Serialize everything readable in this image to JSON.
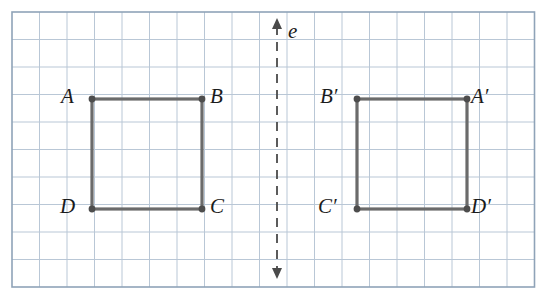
{
  "diagram": {
    "type": "reflection-over-vertical-line",
    "grid": {
      "cell_size": 27.5,
      "columns": 19,
      "rows": 10,
      "line_color": "#b9c7d6",
      "border_color": "#8fa3b8",
      "background": "#ffffff"
    },
    "axis_label": "e",
    "mirror_line": {
      "name": "line-e",
      "color": "#4a4a4a",
      "style": "dashed",
      "x": 277,
      "y_top": 20,
      "y_bottom": 277
    },
    "shapes": [
      {
        "name": "square-ABCD",
        "color": "#6b6b6b",
        "vertices": [
          {
            "label": "A",
            "x": 92,
            "y": 99,
            "label_x": 61,
            "label_y": 88
          },
          {
            "label": "B",
            "x": 202,
            "y": 99,
            "label_x": 210,
            "label_y": 88
          },
          {
            "label": "C",
            "x": 202,
            "y": 209,
            "label_x": 210,
            "label_y": 198
          },
          {
            "label": "D",
            "x": 92,
            "y": 209,
            "label_x": 60,
            "label_y": 198
          }
        ]
      },
      {
        "name": "square-A-prime-B-prime-C-prime-D-prime",
        "color": "#6b6b6b",
        "vertices": [
          {
            "label": "B′",
            "x": 357,
            "y": 99,
            "label_x": 322,
            "label_y": 88
          },
          {
            "label": "A′",
            "x": 467,
            "y": 99,
            "label_x": 473,
            "label_y": 88
          },
          {
            "label": "D′",
            "x": 467,
            "y": 209,
            "label_x": 473,
            "label_y": 198
          },
          {
            "label": "C′",
            "x": 357,
            "y": 209,
            "label_x": 320,
            "label_y": 198
          }
        ]
      }
    ],
    "labels": [
      {
        "text": "A",
        "x": 61,
        "y": 88,
        "name": "vertex-label-a"
      },
      {
        "text": "B",
        "x": 210,
        "y": 88,
        "name": "vertex-label-b"
      },
      {
        "text": "C",
        "x": 210,
        "y": 198,
        "name": "vertex-label-c"
      },
      {
        "text": "D",
        "x": 60,
        "y": 198,
        "name": "vertex-label-d"
      },
      {
        "text": "B′",
        "x": 320,
        "y": 88,
        "name": "vertex-label-b-prime"
      },
      {
        "text": "A′",
        "x": 471,
        "y": 88,
        "name": "vertex-label-a-prime"
      },
      {
        "text": "C′",
        "x": 318,
        "y": 198,
        "name": "vertex-label-c-prime"
      },
      {
        "text": "D′",
        "x": 471,
        "y": 198,
        "name": "vertex-label-d-prime"
      },
      {
        "text": "e",
        "x": 288,
        "y": 22,
        "name": "line-label-e"
      }
    ]
  }
}
